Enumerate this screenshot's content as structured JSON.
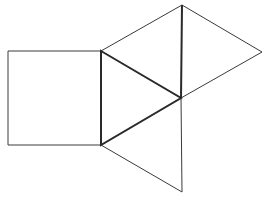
{
  "diagram": {
    "width": 263,
    "height": 199,
    "stroke_color": "#3a3a3a",
    "background": "#ffffff",
    "points": {
      "sq_tl": [
        8,
        51
      ],
      "sq_bl": [
        8,
        145
      ],
      "A": [
        101,
        51
      ],
      "B": [
        101,
        145
      ],
      "C": [
        181,
        98
      ],
      "T": [
        182,
        5
      ],
      "R": [
        262,
        52
      ],
      "D": [
        182,
        192
      ]
    },
    "shapes": [
      {
        "name": "square",
        "points": [
          "sq_tl",
          "A",
          "B",
          "sq_bl"
        ],
        "weight": "thin"
      },
      {
        "name": "center-triangle",
        "points": [
          "A",
          "C",
          "B"
        ],
        "weight": "thick"
      },
      {
        "name": "top-triangle",
        "points": [
          "A",
          "T",
          "C"
        ],
        "weight": "thin"
      },
      {
        "name": "right-triangle",
        "points": [
          "T",
          "R",
          "C"
        ],
        "weight": "thin"
      },
      {
        "name": "bottom-triangle",
        "points": [
          "B",
          "C",
          "D"
        ],
        "weight": "thin"
      }
    ]
  }
}
